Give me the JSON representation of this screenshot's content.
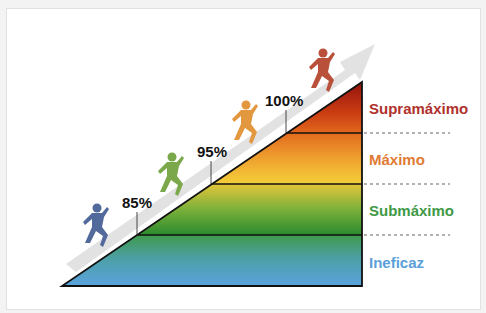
{
  "diagram": {
    "title": "",
    "thresholds": [
      {
        "label": "85%",
        "x": 137,
        "y_line": 235,
        "text_x": 137,
        "text_y": 208
      },
      {
        "label": "95%",
        "x": 211,
        "y_line": 184,
        "text_x": 211,
        "text_y": 157
      },
      {
        "label": "100%",
        "x": 286,
        "y_line": 133,
        "text_x": 281,
        "text_y": 106
      }
    ],
    "zones": [
      {
        "name": "Supramáximo",
        "color": "#b0312c",
        "y": 108
      },
      {
        "name": "Máximo",
        "color": "#e07b33",
        "y": 159
      },
      {
        "name": "Submáximo",
        "color": "#3e9a45",
        "y": 210
      },
      {
        "name": "Ineficaz",
        "color": "#5b9fd8",
        "y": 262
      }
    ],
    "runners": [
      {
        "name": "runner-blue",
        "color": "#52699b"
      },
      {
        "name": "runner-green",
        "color": "#7ba84a"
      },
      {
        "name": "runner-orange",
        "color": "#e39840"
      },
      {
        "name": "runner-red",
        "color": "#b8503a"
      }
    ],
    "arrow_color": "#dcdcdc"
  }
}
